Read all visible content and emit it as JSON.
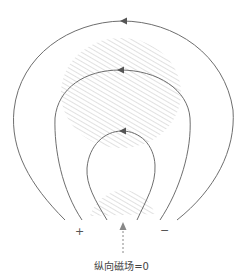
{
  "diagram": {
    "labels": {
      "plus": "+",
      "minus": "−",
      "caption": "纵向磁场=0"
    },
    "colors": {
      "field_line": "#6e6e6e",
      "hatch": "#bdbdbd",
      "arrow_dashed": "#888888"
    },
    "field_lines": [
      {
        "name": "outer-loop",
        "direction": "counterclockwise"
      },
      {
        "name": "middle-loop",
        "direction": "counterclockwise"
      },
      {
        "name": "inner-loop",
        "direction": "counterclockwise"
      }
    ],
    "regions": [
      {
        "name": "upper-hatched-region"
      },
      {
        "name": "lower-hatched-region"
      }
    ]
  }
}
